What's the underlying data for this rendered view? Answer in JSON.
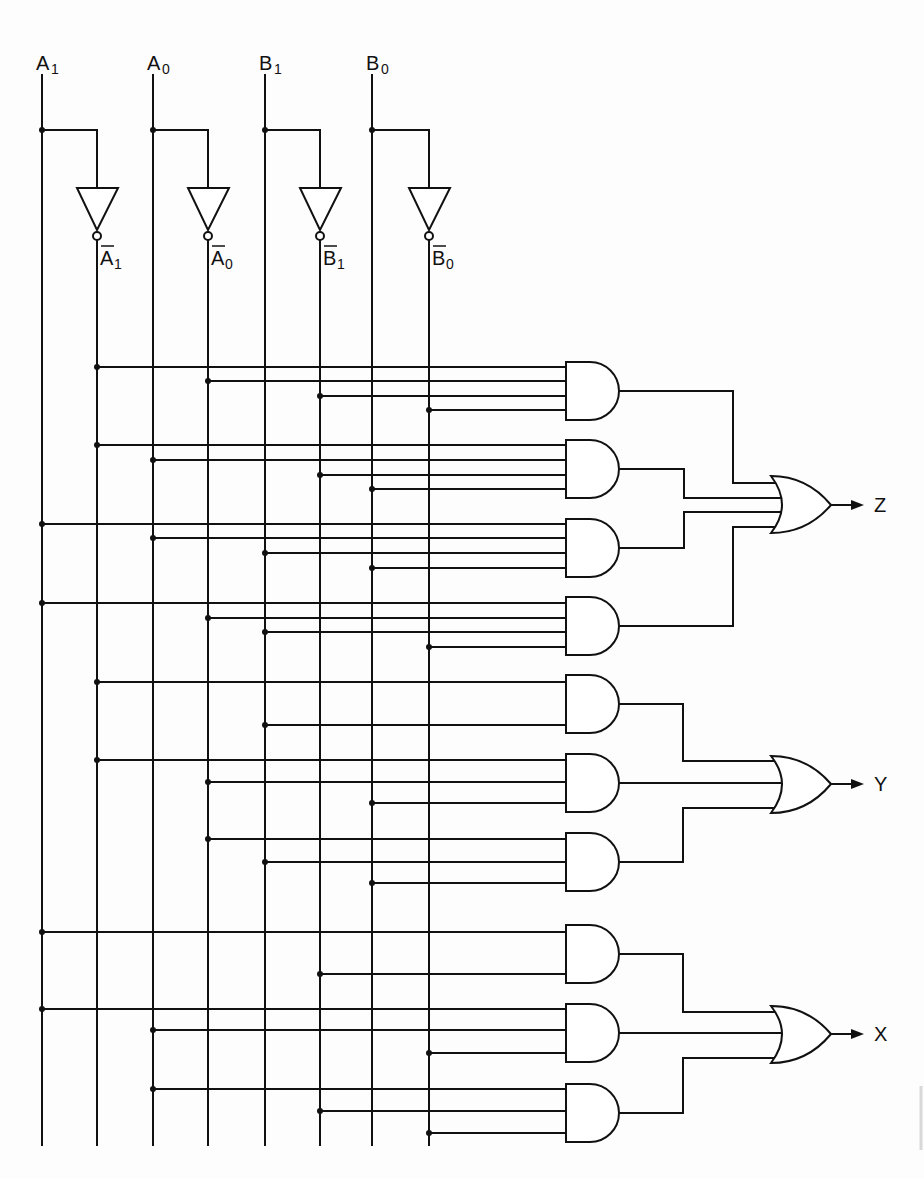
{
  "diagram": {
    "colors": {
      "ink": "#111111",
      "background": "#fdfdfd"
    },
    "input_rails": [
      {
        "id": "A1",
        "label": "A",
        "sub": "1",
        "x": 42,
        "inverted": false
      },
      {
        "id": "A1n",
        "label": "A",
        "sub": "1",
        "x": 97,
        "inverted": true,
        "source": "A1"
      },
      {
        "id": "A0",
        "label": "A",
        "sub": "0",
        "x": 153,
        "inverted": false
      },
      {
        "id": "A0n",
        "label": "A",
        "sub": "0",
        "x": 208,
        "inverted": true,
        "source": "A0"
      },
      {
        "id": "B1",
        "label": "B",
        "sub": "1",
        "x": 265,
        "inverted": false
      },
      {
        "id": "B1n",
        "label": "B",
        "sub": "1",
        "x": 320,
        "inverted": true,
        "source": "B1"
      },
      {
        "id": "B0",
        "label": "B",
        "sub": "0",
        "x": 372,
        "inverted": false
      },
      {
        "id": "B0n",
        "label": "B",
        "sub": "0",
        "x": 429,
        "inverted": true,
        "source": "B0"
      }
    ],
    "and_gates": [
      {
        "id": "g1",
        "top": 362,
        "inputs": [
          {
            "rail": "A1n",
            "y": 367
          },
          {
            "rail": "A0n",
            "y": 381
          },
          {
            "rail": "B1n",
            "y": 396
          },
          {
            "rail": "B0n",
            "y": 410
          }
        ]
      },
      {
        "id": "g2",
        "top": 440,
        "inputs": [
          {
            "rail": "A1n",
            "y": 445
          },
          {
            "rail": "A0",
            "y": 460
          },
          {
            "rail": "B1n",
            "y": 475
          },
          {
            "rail": "B0",
            "y": 489
          }
        ]
      },
      {
        "id": "g3",
        "top": 519,
        "inputs": [
          {
            "rail": "A1",
            "y": 524
          },
          {
            "rail": "A0",
            "y": 538
          },
          {
            "rail": "B1",
            "y": 553
          },
          {
            "rail": "B0",
            "y": 568
          }
        ]
      },
      {
        "id": "g4",
        "top": 597,
        "inputs": [
          {
            "rail": "A1",
            "y": 603
          },
          {
            "rail": "A0n",
            "y": 618
          },
          {
            "rail": "B1",
            "y": 632
          },
          {
            "rail": "B0n",
            "y": 647
          }
        ]
      },
      {
        "id": "g5",
        "top": 675,
        "inputs": [
          {
            "rail": "A1n",
            "y": 682
          },
          {
            "rail": "B1",
            "y": 725
          }
        ]
      },
      {
        "id": "g6",
        "top": 754,
        "inputs": [
          {
            "rail": "A1n",
            "y": 760
          },
          {
            "rail": "A0n",
            "y": 782
          },
          {
            "rail": "B0",
            "y": 803
          }
        ]
      },
      {
        "id": "g7",
        "top": 833,
        "inputs": [
          {
            "rail": "A0n",
            "y": 839
          },
          {
            "rail": "B1",
            "y": 862
          },
          {
            "rail": "B0",
            "y": 883
          }
        ]
      },
      {
        "id": "g8",
        "top": 925,
        "inputs": [
          {
            "rail": "A1",
            "y": 932
          },
          {
            "rail": "B1n",
            "y": 974
          }
        ]
      },
      {
        "id": "g9",
        "top": 1004,
        "inputs": [
          {
            "rail": "A1",
            "y": 1009
          },
          {
            "rail": "A0",
            "y": 1030
          },
          {
            "rail": "B0n",
            "y": 1053
          }
        ]
      },
      {
        "id": "g10",
        "top": 1084,
        "inputs": [
          {
            "rail": "A0",
            "y": 1089
          },
          {
            "rail": "B1n",
            "y": 1111
          },
          {
            "rail": "B0n",
            "y": 1133
          }
        ]
      }
    ],
    "or_gates": [
      {
        "id": "orZ",
        "output_label": "Z",
        "top": 476,
        "out_y": 505,
        "feeds": [
          {
            "gate": "g1",
            "bend_x": 733,
            "in_y": 483
          },
          {
            "gate": "g2",
            "bend_x": 684,
            "in_y": 498
          },
          {
            "gate": "g3",
            "bend_x": 684,
            "in_y": 512
          },
          {
            "gate": "g4",
            "bend_x": 733,
            "in_y": 527
          }
        ]
      },
      {
        "id": "orY",
        "output_label": "Y",
        "top": 756,
        "out_y": 784,
        "feeds": [
          {
            "gate": "g5",
            "bend_x": 683,
            "in_y": 761
          },
          {
            "gate": "g6",
            "bend_x": null,
            "in_y": 783
          },
          {
            "gate": "g7",
            "bend_x": 683,
            "in_y": 808
          }
        ]
      },
      {
        "id": "orX",
        "output_label": "X",
        "top": 1006,
        "out_y": 1034,
        "feeds": [
          {
            "gate": "g8",
            "bend_x": 683,
            "in_y": 1012
          },
          {
            "gate": "g9",
            "bend_x": null,
            "in_y": 1033
          },
          {
            "gate": "g10",
            "bend_x": 683,
            "in_y": 1058
          }
        ]
      }
    ],
    "outputs": [
      "Z",
      "Y",
      "X"
    ]
  }
}
